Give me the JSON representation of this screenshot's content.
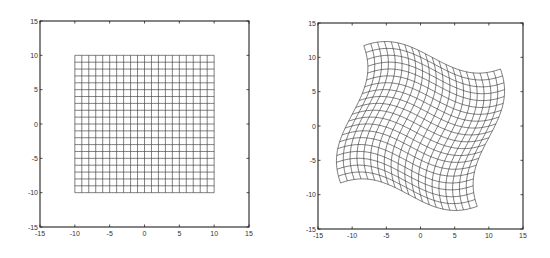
{
  "chart_data": [
    {
      "type": "line",
      "title": "",
      "description": "Regular square grid (undeformed)",
      "xlabel": "",
      "ylabel": "",
      "xlim": [
        -15,
        15
      ],
      "ylim": [
        -15,
        15
      ],
      "xticks": [
        -15,
        -10,
        -5,
        0,
        5,
        10,
        15
      ],
      "yticks": [
        -15,
        -10,
        -5,
        0,
        5,
        10,
        15
      ],
      "xtick_labels": [
        "-15",
        "-10",
        "-5",
        "0",
        "5",
        "10",
        "15"
      ],
      "ytick_labels": [
        "-15",
        "-10",
        "-5",
        "0",
        "5",
        "10",
        "15"
      ],
      "grid": false,
      "mesh": {
        "x_range": [
          -10,
          10
        ],
        "y_range": [
          -10,
          10
        ],
        "step": 1
      },
      "warp": {
        "amplitude": 0,
        "period": 13.6
      },
      "box_px": {
        "left": 40,
        "top": 21,
        "right": 249,
        "bottom": 227
      }
    },
    {
      "type": "line",
      "title": "",
      "description": "Warped (swirl-deformed) grid",
      "xlabel": "",
      "ylabel": "",
      "xlim": [
        -15,
        15
      ],
      "ylim": [
        -15,
        15
      ],
      "xticks": [
        -15,
        -10,
        -5,
        0,
        5,
        10,
        15
      ],
      "yticks": [
        -15,
        -10,
        -5,
        0,
        5,
        10,
        15
      ],
      "xtick_labels": [
        "-15",
        "-10",
        "-5",
        "0",
        "5",
        "10",
        "15"
      ],
      "ytick_labels": [
        "-15",
        "-10",
        "-5",
        "0",
        "5",
        "10",
        "15"
      ],
      "grid": false,
      "mesh": {
        "x_range": [
          -10,
          10
        ],
        "y_range": [
          -10,
          10
        ],
        "step": 1
      },
      "warp": {
        "amplitude": 2.3,
        "period": 13.6
      },
      "corners_mapped": [
        [
          -8.1,
          11.5
        ],
        [
          11.6,
          8.2
        ],
        [
          8.1,
          -11.5
        ],
        [
          -11.6,
          -8.2
        ]
      ],
      "box_px": {
        "left": 318,
        "top": 23,
        "right": 523,
        "bottom": 229
      }
    }
  ],
  "style": {
    "line_color": "#444444",
    "axis_color": "#222222",
    "label_color": "#333333"
  }
}
